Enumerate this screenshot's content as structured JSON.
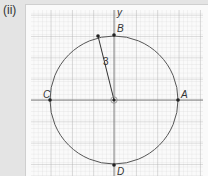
{
  "figure_label": "(ii)",
  "axes": {
    "y_label": "y"
  },
  "circle": {
    "center": [
      0,
      0
    ],
    "radius": 3,
    "radius_label": "3"
  },
  "points": {
    "A": {
      "label": "A",
      "coords": [
        3,
        0
      ]
    },
    "B": {
      "label": "B",
      "coords": [
        0,
        3
      ]
    },
    "C": {
      "label": "C",
      "coords": [
        -3,
        0
      ]
    },
    "D": {
      "label": "D",
      "coords": [
        0,
        -3
      ]
    }
  },
  "colors": {
    "background": "#e4e4e4",
    "paper": "#fafafa",
    "grid_major": "#9a9a9a",
    "grid_minor": "#d2d2d2",
    "curve": "#555555",
    "point": "#222222"
  }
}
